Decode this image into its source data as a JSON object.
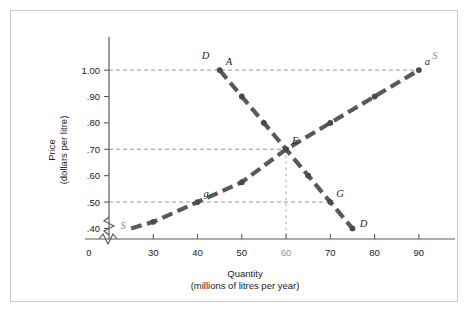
{
  "chart_data": {
    "type": "line",
    "title": "",
    "xlabel": "Quantity",
    "xlabel_sub": "(millions of litres per year)",
    "ylabel": "Price",
    "ylabel_sub": "(dollars per litre)",
    "xlim": [
      20,
      95
    ],
    "ylim": [
      0.36,
      1.08
    ],
    "grid": false,
    "axis_break_x": true,
    "axis_break_y": true,
    "legend_position": "inline-curve-labels",
    "xticks": [
      {
        "value": 0,
        "label": "0",
        "muted": false,
        "origin": true
      },
      {
        "value": 30,
        "label": "30",
        "muted": false
      },
      {
        "value": 40,
        "label": "40",
        "muted": false
      },
      {
        "value": 50,
        "label": "50",
        "muted": false
      },
      {
        "value": 60,
        "label": "60",
        "muted": true
      },
      {
        "value": 70,
        "label": "70",
        "muted": false
      },
      {
        "value": 80,
        "label": "80",
        "muted": false
      },
      {
        "value": 90,
        "label": "90",
        "muted": false
      }
    ],
    "yticks": [
      {
        "value": 1.0,
        "label": "1.00"
      },
      {
        "value": 0.9,
        "label": ".90"
      },
      {
        "value": 0.8,
        "label": ".80"
      },
      {
        "value": 0.7,
        "label": ".70"
      },
      {
        "value": 0.6,
        "label": ".60"
      },
      {
        "value": 0.5,
        "label": ".50"
      },
      {
        "value": 0.4,
        "label": ".40"
      }
    ],
    "series": [
      {
        "name": "Demand",
        "curve_label": "D",
        "label_start": "D",
        "label_end": "D",
        "x": [
          45,
          50,
          55,
          60,
          65,
          70,
          75
        ],
        "y": [
          1.0,
          0.9,
          0.8,
          0.7,
          0.6,
          0.5,
          0.4
        ],
        "points": [
          {
            "x": 45,
            "y": 1.0,
            "label": "A"
          },
          {
            "x": 50,
            "y": 0.9,
            "label": ""
          },
          {
            "x": 55,
            "y": 0.8,
            "label": ""
          },
          {
            "x": 60,
            "y": 0.7,
            "label": "E"
          },
          {
            "x": 65,
            "y": 0.6,
            "label": ""
          },
          {
            "x": 70,
            "y": 0.5,
            "label": "G"
          },
          {
            "x": 75,
            "y": 0.4,
            "label": ""
          }
        ]
      },
      {
        "name": "Supply",
        "curve_label": "S",
        "label_start": "S",
        "label_end": "S",
        "x": [
          25,
          30,
          40,
          50,
          60,
          70,
          80,
          90
        ],
        "y": [
          0.4,
          0.425,
          0.5,
          0.575,
          0.7,
          0.8,
          0.9,
          1.0
        ],
        "points": [
          {
            "x": 30,
            "y": 0.425,
            "label": ""
          },
          {
            "x": 40,
            "y": 0.5,
            "label": "g"
          },
          {
            "x": 50,
            "y": 0.575,
            "label": ""
          },
          {
            "x": 60,
            "y": 0.7,
            "label": "E"
          },
          {
            "x": 70,
            "y": 0.8,
            "label": ""
          },
          {
            "x": 80,
            "y": 0.9,
            "label": ""
          },
          {
            "x": 90,
            "y": 1.0,
            "label": "a"
          }
        ]
      }
    ],
    "guide_lines": [
      {
        "type": "horizontal",
        "value": 1.0,
        "from_x": 20,
        "to_x": 90
      },
      {
        "type": "horizontal",
        "value": 0.7,
        "from_x": 20,
        "to_x": 60
      },
      {
        "type": "horizontal",
        "value": 0.5,
        "from_x": 20,
        "to_x": 70
      },
      {
        "type": "vertical",
        "value": 60,
        "from_y": 0.36,
        "to_y": 0.7
      }
    ],
    "annotations": [
      {
        "label": "A",
        "x": 45,
        "y": 1.0
      },
      {
        "label": "a",
        "x": 90,
        "y": 1.0
      },
      {
        "label": "E",
        "x": 60,
        "y": 0.7
      },
      {
        "label": "g",
        "x": 40,
        "y": 0.5
      },
      {
        "label": "G",
        "x": 70,
        "y": 0.5
      }
    ]
  }
}
